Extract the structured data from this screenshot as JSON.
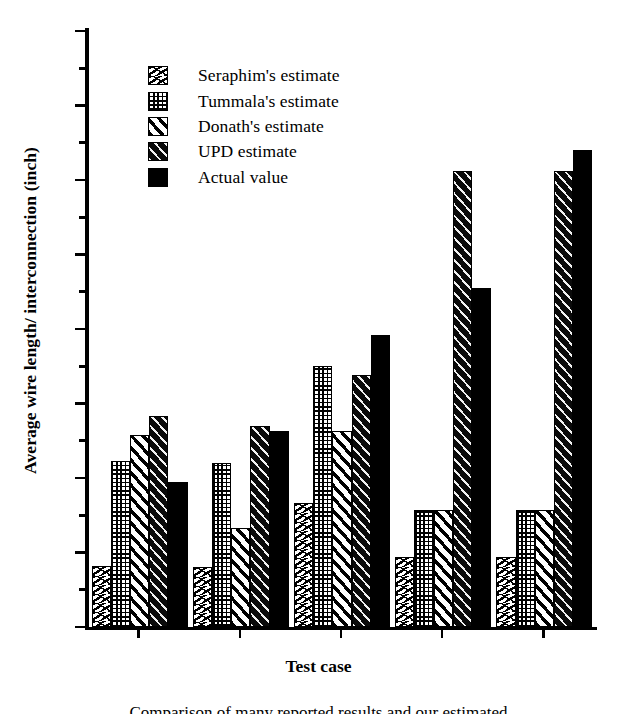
{
  "chart_data": {
    "type": "bar",
    "title": "",
    "xlabel": "Test case",
    "ylabel": "Average wire length/ interconnection (inch)",
    "categories": [
      "1",
      "2",
      "3",
      "4",
      "5"
    ],
    "ylim": [
      0,
      8
    ],
    "yticks": [
      0,
      1,
      2,
      3,
      4,
      5,
      6,
      7,
      8
    ],
    "ytick_labels": [
      "0",
      "1",
      "2",
      "3",
      "4",
      "5",
      "6",
      "7",
      "8"
    ],
    "minor_yticks": [
      0.5,
      1.5,
      2.5,
      3.5,
      4.5,
      5.5,
      6.5,
      7.5
    ],
    "grid": false,
    "legend_position": "upper left inside",
    "series": [
      {
        "name": "Seraphim's estimate",
        "pattern": "p-seraphim",
        "values": [
          0.82,
          0.8,
          1.66,
          0.94,
          0.94
        ]
      },
      {
        "name": "Tummala's estimate",
        "pattern": "p-tummala",
        "values": [
          2.23,
          2.2,
          3.5,
          1.57,
          1.57
        ]
      },
      {
        "name": "Donath's estimate",
        "pattern": "p-donath",
        "values": [
          2.58,
          1.33,
          2.63,
          1.57,
          1.57
        ]
      },
      {
        "name": "UPD estimate",
        "pattern": "p-upd",
        "values": [
          2.83,
          2.7,
          3.38,
          6.12,
          6.12
        ]
      },
      {
        "name": "Actual value",
        "pattern": "p-actual",
        "values": [
          1.94,
          2.63,
          3.92,
          4.55,
          6.4
        ]
      }
    ]
  },
  "legend": {
    "items": [
      {
        "label": "Seraphim's estimate"
      },
      {
        "label": "Tummala's estimate"
      },
      {
        "label": "Donath's estimate"
      },
      {
        "label": "UPD estimate"
      },
      {
        "label": "Actual value"
      }
    ]
  },
  "caption": "Comparison of many reported results and our estimated"
}
